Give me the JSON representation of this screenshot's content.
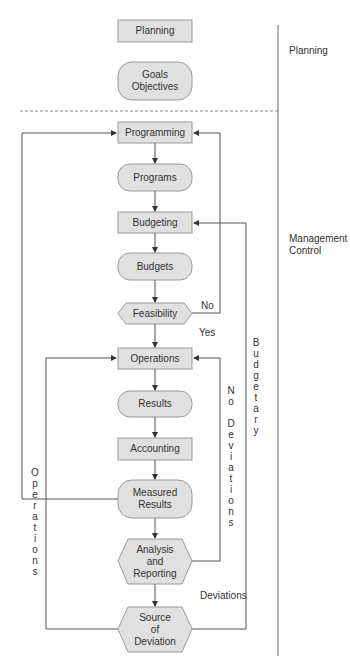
{
  "sections": {
    "planning": "Planning",
    "management_control": [
      "Management",
      "Control"
    ]
  },
  "nodes": {
    "planning": "Planning",
    "goals": [
      "Goals",
      "Objectives"
    ],
    "programming": "Programming",
    "programs": "Programs",
    "budgeting": "Budgeting",
    "budgets": "Budgets",
    "feasibility": "Feasibility",
    "operations": "Operations",
    "results": "Results",
    "accounting": "Accounting",
    "measured_results": [
      "Measured",
      "Results"
    ],
    "analysis": [
      "Analysis",
      "and",
      "Reporting"
    ],
    "source": [
      "Source",
      "of",
      "Deviation"
    ]
  },
  "edge_labels": {
    "no": "No",
    "yes": "Yes",
    "deviations": "Deviations",
    "no_deviations_v": "N\no\n\nD\ne\nv\ni\na\nt\ni\no\nn\ns",
    "budgetary_v": "B\nu\nd\ng\ne\nt\na\nr\ny",
    "operations_v": "O\np\ne\nr\na\nt\ni\no\nn\ns"
  },
  "colors": {
    "node_fill": "#e0e0e0",
    "node_stroke": "#9a9a9a",
    "line": "#555555"
  }
}
